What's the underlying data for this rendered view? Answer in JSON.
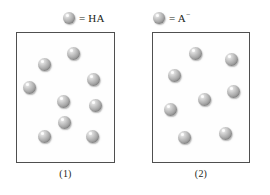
{
  "figure": {
    "background_color": "#ffffff",
    "ink_color": "#231f20",
    "border_color": "#4f4f4f",
    "sphere_color": "#b0b0b0"
  },
  "legend": {
    "items": [
      {
        "icon": "gray-sphere",
        "equals": "=",
        "species": "HA",
        "charge": "",
        "label": "= HA"
      },
      {
        "icon": "gray-sphere",
        "equals": "=",
        "species": "A",
        "charge": "−",
        "label": "= A−"
      }
    ]
  },
  "panels": [
    {
      "id": "1",
      "caption": "(1)",
      "particle_count": 9,
      "particle_species": "HA",
      "particles": [
        {
          "x": 21,
          "y": 25
        },
        {
          "x": 50,
          "y": 14
        },
        {
          "x": 6,
          "y": 48
        },
        {
          "x": 70,
          "y": 40
        },
        {
          "x": 40,
          "y": 62
        },
        {
          "x": 72,
          "y": 66
        },
        {
          "x": 21,
          "y": 97
        },
        {
          "x": 69,
          "y": 97
        },
        {
          "x": 41,
          "y": 83
        }
      ]
    },
    {
      "id": "2",
      "caption": "(2)",
      "particle_count": 8,
      "particle_species": "A",
      "particles": [
        {
          "x": 36,
          "y": 14
        },
        {
          "x": 72,
          "y": 20
        },
        {
          "x": 15,
          "y": 36
        },
        {
          "x": 74,
          "y": 52
        },
        {
          "x": 45,
          "y": 60
        },
        {
          "x": 11,
          "y": 70
        },
        {
          "x": 25,
          "y": 98
        },
        {
          "x": 66,
          "y": 94
        }
      ]
    }
  ]
}
